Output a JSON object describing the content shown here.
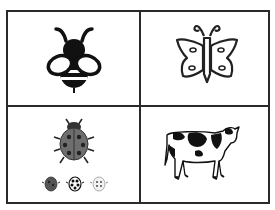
{
  "grid": {
    "rows": 2,
    "cols": 2,
    "border_color": "#2a2a2a",
    "cells": [
      {
        "position": "top-left",
        "subject": "bee",
        "icon": "bee-icon",
        "style": "black-filled"
      },
      {
        "position": "top-right",
        "subject": "butterfly",
        "icon": "butterfly-icon",
        "style": "outline"
      },
      {
        "position": "bottom-left",
        "subject": "ladybugs",
        "icon": "ladybug-icon",
        "style": "gray",
        "small_count": 3
      },
      {
        "position": "bottom-right",
        "subject": "cow",
        "icon": "cow-icon",
        "style": "line-drawing"
      }
    ]
  },
  "colors": {
    "ink": "#111111",
    "ladybug_body": "#6e6e6e",
    "background": "#ffffff"
  }
}
